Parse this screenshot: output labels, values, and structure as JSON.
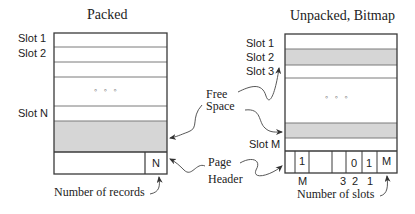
{
  "colors": {
    "outline": "#3a3a3a",
    "divider": "#7a7a7a",
    "shaded": "#d6d6d6",
    "background": "#ffffff",
    "text": "#222222"
  },
  "packed": {
    "title": "Packed",
    "slot_labels": [
      "Slot 1",
      "Slot 2",
      "Slot N"
    ],
    "ellipsis": "◦ ◦ ◦",
    "header_cell": "N",
    "caption": "Number of records"
  },
  "unpacked": {
    "title": "Unpacked, Bitmap",
    "slot_labels": [
      "Slot 1",
      "Slot 2",
      "Slot 3",
      "Slot M"
    ],
    "ellipsis": "◦ ◦ ◦",
    "bitmap_cells": [
      "",
      "1",
      "",
      "",
      "0",
      "1",
      "M"
    ],
    "bitmap_indices": [
      "M",
      "3",
      "2",
      "1"
    ],
    "caption": "Number of slots"
  },
  "annotations": {
    "free_space_line1": "Free",
    "free_space_line2": "Space",
    "page_header_line1": "Page",
    "page_header_line2": "Header"
  }
}
